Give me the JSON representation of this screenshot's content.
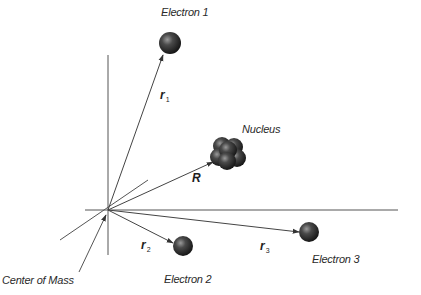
{
  "diagram": {
    "labels": {
      "electron1": "Electron 1",
      "electron2": "Electron 2",
      "electron3": "Electron 3",
      "nucleus": "Nucleus",
      "center_of_mass": "Center of Mass"
    },
    "vectors": {
      "r1": {
        "symbol": "r",
        "subscript": "1"
      },
      "r2": {
        "symbol": "r",
        "subscript": "2"
      },
      "r3": {
        "symbol": "r",
        "subscript": "3"
      },
      "R": {
        "symbol": "R",
        "subscript": ""
      }
    },
    "colors": {
      "line": "#444444",
      "particle_dark": "#1a1a1a",
      "particle_light": "#8a8a8a",
      "text": "#2a2a2a"
    }
  }
}
